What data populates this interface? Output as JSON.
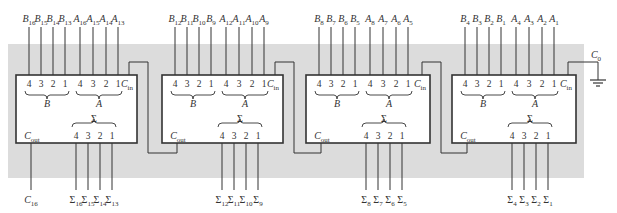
{
  "colors": {
    "background": "#ffffff",
    "panel": "#dcdcdc",
    "box_fill": "#ffffff",
    "line": "#333333"
  },
  "adders": [
    {
      "id": "adder-bits-13-16",
      "b_inputs": [
        {
          "base": "B",
          "sub": "16"
        },
        {
          "base": "B",
          "sub": "15"
        },
        {
          "base": "B",
          "sub": "14"
        },
        {
          "base": "B",
          "sub": "13"
        }
      ],
      "a_inputs": [
        {
          "base": "A",
          "sub": "16"
        },
        {
          "base": "A",
          "sub": "15"
        },
        {
          "base": "A",
          "sub": "14"
        },
        {
          "base": "A",
          "sub": "13"
        }
      ],
      "sum_outputs": [
        {
          "base": "Σ",
          "sub": "16"
        },
        {
          "base": "Σ",
          "sub": "15"
        },
        {
          "base": "Σ",
          "sub": "14"
        },
        {
          "base": "Σ",
          "sub": "13"
        }
      ],
      "carry_out_label": {
        "base": "C",
        "sub": "16"
      }
    },
    {
      "id": "adder-bits-9-12",
      "b_inputs": [
        {
          "base": "B",
          "sub": "12"
        },
        {
          "base": "B",
          "sub": "11"
        },
        {
          "base": "B",
          "sub": "10"
        },
        {
          "base": "B",
          "sub": "9"
        }
      ],
      "a_inputs": [
        {
          "base": "A",
          "sub": "12"
        },
        {
          "base": "A",
          "sub": "11"
        },
        {
          "base": "A",
          "sub": "10"
        },
        {
          "base": "A",
          "sub": "9"
        }
      ],
      "sum_outputs": [
        {
          "base": "Σ",
          "sub": "12"
        },
        {
          "base": "Σ",
          "sub": "11"
        },
        {
          "base": "Σ",
          "sub": "10"
        },
        {
          "base": "Σ",
          "sub": "9"
        }
      ]
    },
    {
      "id": "adder-bits-5-8",
      "b_inputs": [
        {
          "base": "B",
          "sub": "8"
        },
        {
          "base": "B",
          "sub": "7"
        },
        {
          "base": "B",
          "sub": "6"
        },
        {
          "base": "B",
          "sub": "5"
        }
      ],
      "a_inputs": [
        {
          "base": "A",
          "sub": "8"
        },
        {
          "base": "A",
          "sub": "7"
        },
        {
          "base": "A",
          "sub": "6"
        },
        {
          "base": "A",
          "sub": "5"
        }
      ],
      "sum_outputs": [
        {
          "base": "Σ",
          "sub": "8"
        },
        {
          "base": "Σ",
          "sub": "7"
        },
        {
          "base": "Σ",
          "sub": "6"
        },
        {
          "base": "Σ",
          "sub": "5"
        }
      ]
    },
    {
      "id": "adder-bits-1-4",
      "b_inputs": [
        {
          "base": "B",
          "sub": "4"
        },
        {
          "base": "B",
          "sub": "3"
        },
        {
          "base": "B",
          "sub": "2"
        },
        {
          "base": "B",
          "sub": "1"
        }
      ],
      "a_inputs": [
        {
          "base": "A",
          "sub": "4"
        },
        {
          "base": "A",
          "sub": "3"
        },
        {
          "base": "A",
          "sub": "2"
        },
        {
          "base": "A",
          "sub": "1"
        }
      ],
      "sum_outputs": [
        {
          "base": "Σ",
          "sub": "4"
        },
        {
          "base": "Σ",
          "sub": "3"
        },
        {
          "base": "Σ",
          "sub": "2"
        },
        {
          "base": "Σ",
          "sub": "1"
        }
      ]
    }
  ],
  "pin_numbers": [
    "4",
    "3",
    "2",
    "1"
  ],
  "group_labels": {
    "b": "B",
    "a": "A",
    "sum": "Σ"
  },
  "carry_in_label": {
    "base": "C",
    "sub": "in"
  },
  "carry_out_pin_label": {
    "base": "C",
    "sub": "out"
  },
  "initial_carry_label": {
    "base": "C",
    "sub": "0"
  },
  "ground_icon": "ground-icon"
}
